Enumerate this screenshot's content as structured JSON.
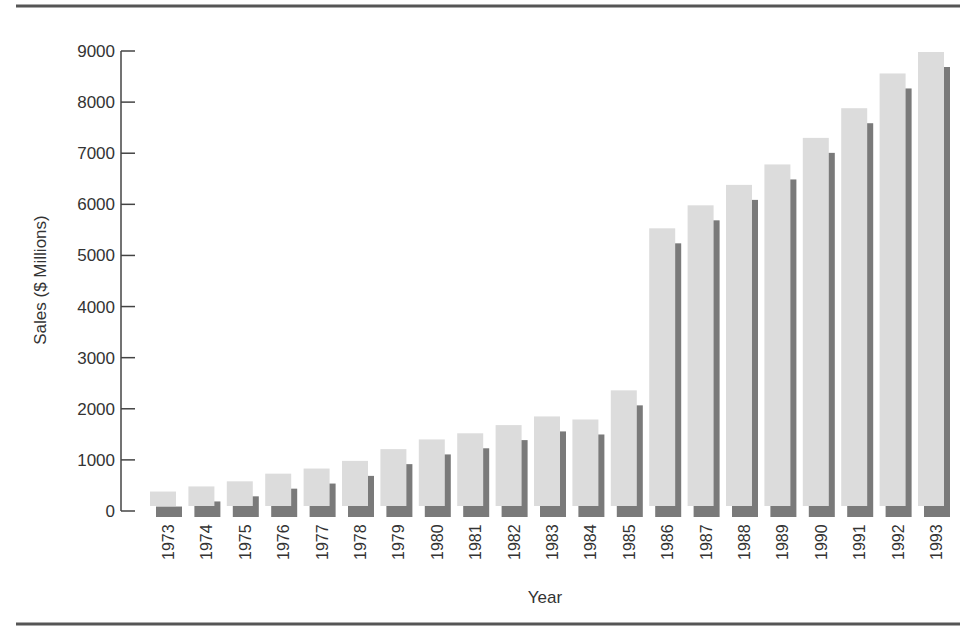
{
  "chart_data": {
    "type": "bar",
    "title": "",
    "xlabel": "Year",
    "ylabel": "Sales ($ Millions)",
    "ylim": [
      0,
      9000
    ],
    "yticks": [
      0,
      1000,
      2000,
      3000,
      4000,
      5000,
      6000,
      7000,
      8000,
      9000
    ],
    "grid": false,
    "legend": null,
    "categories": [
      "1973",
      "1974",
      "1975",
      "1976",
      "1977",
      "1978",
      "1979",
      "1980",
      "1981",
      "1982",
      "1983",
      "1984",
      "1985",
      "1986",
      "1987",
      "1988",
      "1989",
      "1990",
      "1991",
      "1992",
      "1993"
    ],
    "values": [
      400,
      500,
      600,
      750,
      850,
      1000,
      1230,
      1420,
      1540,
      1700,
      1870,
      1810,
      2380,
      5550,
      6000,
      6400,
      6800,
      7320,
      7900,
      8580,
      9000
    ]
  },
  "colors": {
    "bar_face": "#dcdcdc",
    "bar_shadow": "#7a7a7a",
    "axis": "#444444",
    "rule": "#555555"
  }
}
